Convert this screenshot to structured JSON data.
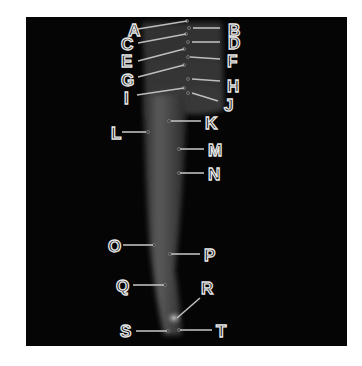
{
  "figure": {
    "background_color": "#050505",
    "label_color": "#e8e8e8",
    "labels": [
      {
        "id": "A",
        "text": "A",
        "x": 128,
        "y": 36,
        "line": [
          138,
          29,
          187,
          21
        ]
      },
      {
        "id": "B",
        "text": "B",
        "x": 228,
        "y": 36,
        "line": [
          193,
          28,
          220,
          28
        ]
      },
      {
        "id": "C",
        "text": "C",
        "x": 121,
        "y": 50,
        "line": [
          138,
          43,
          186,
          34
        ]
      },
      {
        "id": "D",
        "text": "D",
        "x": 228,
        "y": 49,
        "line": [
          192,
          42,
          220,
          42
        ]
      },
      {
        "id": "E",
        "text": "E",
        "x": 121,
        "y": 67,
        "line": [
          138,
          61,
          184,
          49
        ]
      },
      {
        "id": "F",
        "text": "F",
        "x": 227,
        "y": 67,
        "line": [
          190,
          57,
          220,
          59
        ]
      },
      {
        "id": "G",
        "text": "G",
        "x": 121,
        "y": 86,
        "line": [
          138,
          77,
          184,
          65
        ]
      },
      {
        "id": "H",
        "text": "H",
        "x": 227,
        "y": 92,
        "line": [
          192,
          79,
          220,
          81
        ]
      },
      {
        "id": "I",
        "text": "I",
        "x": 124,
        "y": 104,
        "line": [
          137,
          95,
          184,
          88
        ]
      },
      {
        "id": "J",
        "text": "J",
        "x": 224,
        "y": 111,
        "line": [
          192,
          93,
          218,
          101
        ]
      },
      {
        "id": "K",
        "text": "K",
        "x": 205,
        "y": 129,
        "line": [
          171,
          121,
          201,
          121
        ]
      },
      {
        "id": "L",
        "text": "L",
        "x": 111,
        "y": 139,
        "line": [
          122,
          132,
          146,
          132
        ]
      },
      {
        "id": "M",
        "text": "M",
        "x": 208,
        "y": 156,
        "line": [
          180,
          149,
          204,
          149
        ]
      },
      {
        "id": "N",
        "text": "N",
        "x": 208,
        "y": 180,
        "line": [
          180,
          173,
          204,
          173
        ]
      },
      {
        "id": "O",
        "text": "O",
        "x": 108,
        "y": 252,
        "line": [
          123,
          245,
          153,
          245
        ]
      },
      {
        "id": "P",
        "text": "P",
        "x": 204,
        "y": 261,
        "line": [
          171,
          254,
          200,
          254
        ]
      },
      {
        "id": "Q",
        "text": "Q",
        "x": 116,
        "y": 292,
        "line": [
          133,
          285,
          164,
          285
        ]
      },
      {
        "id": "R",
        "text": "R",
        "x": 201,
        "y": 294,
        "line": [
          200,
          298,
          177,
          318
        ]
      },
      {
        "id": "S",
        "text": "S",
        "x": 120,
        "y": 337,
        "line": [
          136,
          331,
          167,
          331
        ]
      },
      {
        "id": "T",
        "text": "T",
        "x": 216,
        "y": 337,
        "line": [
          180,
          330,
          212,
          330
        ]
      }
    ]
  }
}
